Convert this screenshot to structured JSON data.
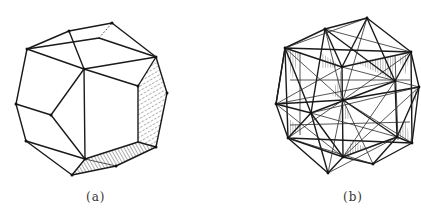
{
  "figure": {
    "panels": [
      {
        "id": "a",
        "label": "(a)",
        "description": "Polyhedron (truncated cube-like solid) with two hatched faces",
        "stroke_color": "#1a1a1a",
        "hatch_color": "#333333"
      },
      {
        "id": "b",
        "label": "(b)",
        "description": "Compound stellated polyhedron with densely triangulated faces and hatched facets",
        "stroke_color": "#1a1a1a",
        "hatch_color": "#333333"
      }
    ]
  }
}
